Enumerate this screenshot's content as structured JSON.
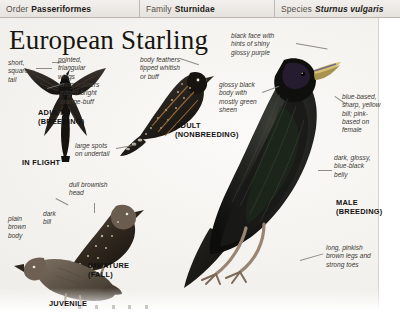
{
  "taxonomy": {
    "order": {
      "rank": "Order",
      "value": "Passeriformes"
    },
    "family": {
      "rank": "Family",
      "value": "Sturnidae"
    },
    "species": {
      "rank": "Species",
      "value": "Sturnus vulgaris"
    }
  },
  "title": "European Starling",
  "callouts": {
    "short_square_tail": "short,\nsquare\ntail",
    "pointed_triangular_wings": "pointed,\ntriangular\nwings",
    "wing_feathers_edged": "wing feathers\nedged bright\norange-buff",
    "body_feathers_tipped": "body feathers\ntipped whitish\nor buff",
    "large_spots_undertail": "large spots\non undertail",
    "glossy_black_body": "glossy black\nbody with\nmostly green\nsheen",
    "black_face": "black face with\nhints of shiny\nglossy purple",
    "blue_based_bill": "blue-based,\nsharp, yellow\nbill; pink-\nbased on\nfemale",
    "dark_glossy_belly": "dark, glossy,\nblue-black\nbelly",
    "long_pinkish_legs": "long, pinkish\nbrown legs and\nstrong toes",
    "dull_brownish_head": "dull brownish\nhead",
    "plain_brown_body": "plain\nbrown\nbody",
    "dark_bill": "dark\nbill"
  },
  "plate_labels": {
    "adult_breeding": "ADULT\n(BREEDING)",
    "in_flight": "IN FLIGHT",
    "adult_nonbreeding": "ADULT\n(NONBREEDING)",
    "male_breeding": "MALE\n(BREEDING)",
    "immature_fall": "IMMATURE\n(FALL)",
    "juvenile": "JUVENILE"
  },
  "colors": {
    "page_bg": "#f4f2ef",
    "header_bg": "#eae7e2",
    "ink": "#17150f",
    "label_ink": "#3b3833",
    "plumage_dark": "#1b1a18",
    "plumage_brown": "#6e6255",
    "bill_yellow": "#d8c170"
  }
}
